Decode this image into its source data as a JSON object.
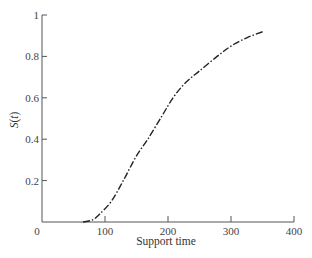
{
  "chart_data": {
    "type": "line",
    "title": "",
    "xlabel": "Support time",
    "ylabel": "S(t)",
    "xlim": [
      0,
      400
    ],
    "ylim": [
      0,
      1
    ],
    "xticks": [
      0,
      100,
      200,
      300,
      400
    ],
    "xtick_labels": [
      "0",
      "100",
      "200",
      "300",
      "400"
    ],
    "yticks": [
      0.2,
      0.4,
      0.6,
      0.8,
      1
    ],
    "ytick_labels": [
      "0.2",
      "0.4",
      "0.6",
      "0.8",
      "1"
    ],
    "grid": false,
    "legend": null,
    "series": [
      {
        "name": "S(t)",
        "line_style": "dash-dot",
        "color": "#222222",
        "x": [
          65,
          80,
          92,
          110,
          129,
          150,
          168,
          190,
          208,
          227,
          250,
          278,
          300,
          325,
          351
        ],
        "y": [
          0.0,
          0.01,
          0.04,
          0.1,
          0.2,
          0.32,
          0.4,
          0.51,
          0.6,
          0.67,
          0.73,
          0.8,
          0.85,
          0.89,
          0.92
        ]
      }
    ]
  },
  "axes": {
    "origin_label": "0",
    "x_title": "Support time",
    "y_title_main": "S",
    "y_title_arg": "(t)"
  }
}
